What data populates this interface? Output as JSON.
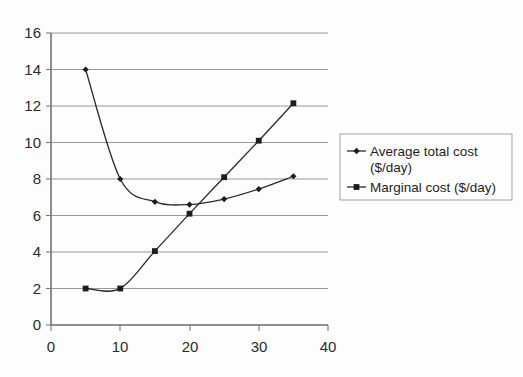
{
  "chart_data": {
    "type": "line",
    "title": "",
    "xlabel": "",
    "ylabel": "",
    "xlim": [
      0,
      40
    ],
    "ylim": [
      0,
      16
    ],
    "grid": true,
    "grid_axis": "y",
    "legend_position": "right",
    "x": [
      5,
      10,
      15,
      20,
      25,
      30,
      35
    ],
    "xticks": [
      0,
      10,
      20,
      30,
      40
    ],
    "yticks": [
      0,
      2,
      4,
      6,
      8,
      10,
      12,
      14,
      16
    ],
    "xtick_labels": [
      "0",
      "10",
      "20",
      "30",
      "40"
    ],
    "ytick_labels": [
      "0",
      "2",
      "4",
      "6",
      "8",
      "10",
      "12",
      "14",
      "16"
    ],
    "series": [
      {
        "name": "Average total cost ($/day)",
        "marker": "diamond",
        "color": "#1c1c1c",
        "values": [
          14,
          8,
          6.75,
          6.6,
          6.9,
          7.45,
          8.15
        ]
      },
      {
        "name": "Marginal cost ($/day)",
        "marker": "square",
        "color": "#1c1c1c",
        "values": [
          2,
          2,
          4.05,
          6.1,
          8.1,
          10.1,
          12.15
        ]
      }
    ]
  },
  "legend": {
    "entries": [
      {
        "label_line1": "Average total cost",
        "label_line2": "($/day)",
        "marker": "diamond-marker-icon"
      },
      {
        "label_line1": "Marginal cost ($/day)",
        "label_line2": "",
        "marker": "square-marker-icon"
      }
    ]
  },
  "axes": {
    "y_labels": [
      "16",
      "14",
      "12",
      "10",
      "8",
      "6",
      "4",
      "2",
      "0"
    ],
    "x_labels": [
      "0",
      "10",
      "20",
      "30",
      "40"
    ]
  }
}
